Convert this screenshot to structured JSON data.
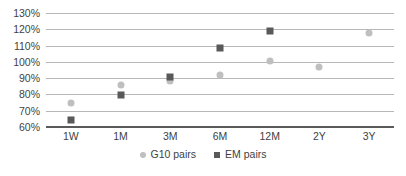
{
  "chart_data": {
    "type": "scatter",
    "title": "",
    "subtitle": "",
    "xlabel": "",
    "ylabel": "",
    "categories": [
      "1W",
      "1M",
      "3M",
      "6M",
      "12M",
      "2Y",
      "3Y"
    ],
    "ylim": [
      60,
      130
    ],
    "ytick_labels": [
      "130%",
      "120%",
      "110%",
      "100%",
      "90%",
      "80%",
      "70%",
      "60%"
    ],
    "ytick_values": [
      130,
      120,
      110,
      100,
      90,
      80,
      70,
      60
    ],
    "grid": true,
    "legend_position": "bottom",
    "series": [
      {
        "name": "G10 pairs",
        "marker": "circle",
        "color": "#bfbfbf",
        "values": [
          75,
          86,
          88,
          92,
          100.5,
          97,
          118
        ]
      },
      {
        "name": "EM pairs",
        "marker": "square",
        "color": "#595959",
        "values": [
          64.5,
          79.5,
          91,
          108.5,
          119,
          null,
          null
        ]
      }
    ]
  },
  "legend": {
    "items": [
      {
        "label": "G10 pairs",
        "icon": "circle-marker-icon"
      },
      {
        "label": "EM pairs",
        "icon": "square-marker-icon"
      }
    ]
  },
  "colors": {
    "g10": "#bfbfbf",
    "em": "#595959",
    "gridline": "#b7b7b7",
    "axis": "#5a5a5a",
    "text": "#3f3f3f",
    "background": "#ffffff"
  }
}
